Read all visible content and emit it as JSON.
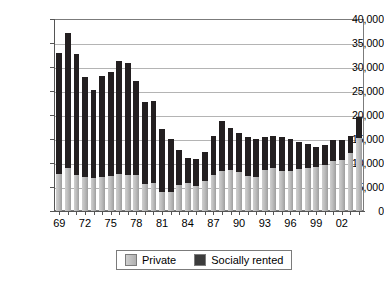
{
  "chart_data": {
    "type": "bar",
    "stacked": true,
    "title": "",
    "subtitle": "",
    "xlabel": "",
    "ylabel": "",
    "ylim": [
      0,
      40000
    ],
    "ytick_step": 5000,
    "ytick_labels": [
      "40,000",
      "35,000",
      "30,000",
      "25,000",
      "20,000",
      "15,000",
      "10,000",
      "5,000",
      "0"
    ],
    "ytick_values": [
      40000,
      35000,
      30000,
      25000,
      20000,
      15000,
      10000,
      5000,
      0
    ],
    "grid": true,
    "grid_axis": "y",
    "legend_position": "bottom",
    "categories": [
      "69",
      "70",
      "71",
      "72",
      "73",
      "74",
      "75",
      "76",
      "77",
      "78",
      "79",
      "80",
      "81",
      "82",
      "83",
      "84",
      "85",
      "86",
      "87",
      "88",
      "89",
      "90",
      "91",
      "92",
      "93",
      "94",
      "95",
      "96",
      "97",
      "98",
      "99",
      "00",
      "01",
      "02",
      "03",
      "04"
    ],
    "xtick_labels_shown": [
      "69",
      "72",
      "75",
      "78",
      "81",
      "84",
      "87",
      "90",
      "93",
      "96",
      "99",
      "02"
    ],
    "xtick_label_interval": 3,
    "series": [
      {
        "name": "Private",
        "color": "#c0c0c0",
        "values": [
          7700,
          9000,
          7600,
          7100,
          6900,
          7100,
          7200,
          7800,
          7600,
          7500,
          5700,
          5800,
          4000,
          3900,
          5400,
          5800,
          5300,
          6300,
          7400,
          8300,
          8600,
          8100,
          7300,
          7000,
          8500,
          8900,
          8300,
          8400,
          8800,
          8900,
          9100,
          9600,
          10400,
          10700,
          12000,
          15200
        ]
      },
      {
        "name": "Socially rented",
        "color": "#231f20",
        "values": [
          25300,
          28000,
          25100,
          20900,
          18300,
          21000,
          21800,
          23400,
          23200,
          19500,
          17000,
          17200,
          13100,
          11200,
          7300,
          5300,
          5600,
          5900,
          8300,
          10500,
          8600,
          8200,
          8200,
          8000,
          7000,
          6700,
          7100,
          6700,
          5600,
          5100,
          4300,
          4200,
          4400,
          4000,
          3700,
          4300
        ]
      }
    ],
    "totals": [
      33000,
      37000,
      32700,
      28000,
      25200,
      28100,
      29000,
      31200,
      30800,
      27000,
      22700,
      23000,
      17100,
      15100,
      12700,
      11100,
      10900,
      12200,
      15700,
      18800,
      17200,
      16300,
      15500,
      15000,
      15500,
      15600,
      15400,
      15100,
      14400,
      14000,
      13400,
      13800,
      14800,
      14700,
      15700,
      19500
    ]
  },
  "legend": {
    "items": [
      {
        "label": "Private",
        "swatch": "legend-swatch-private"
      },
      {
        "label": "Socially rented",
        "swatch": "legend-swatch-socially-rented"
      }
    ]
  }
}
